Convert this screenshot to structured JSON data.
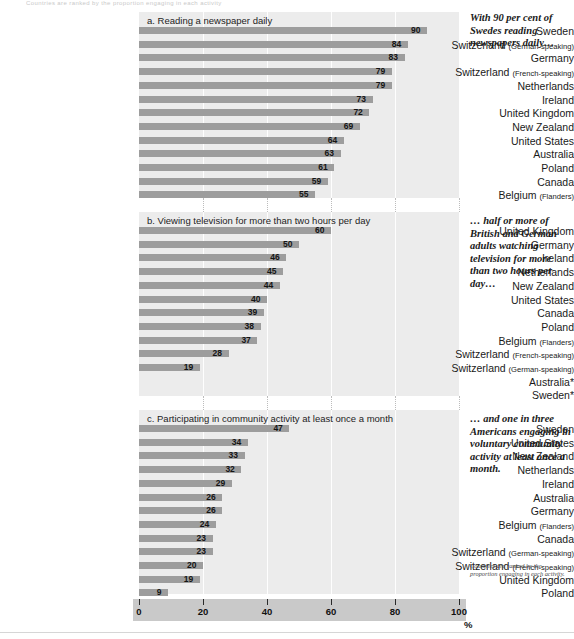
{
  "document": {
    "top_remnant": "Countries are ranked by the proportion engaging in each activity",
    "percent_symbol": "%",
    "footnote": "Countries are ranked by the proportion engaging in each activity."
  },
  "axis": {
    "ticks": [
      0,
      20,
      40,
      60,
      80,
      100
    ],
    "min": 0,
    "max": 100,
    "unit": "%"
  },
  "notes": {
    "a": "With 90 per cent of Swedes reading newspapers daily…",
    "b": "… half or more of British and German adults watching television for more than two hours per day…",
    "c": "… and one in three Americans engaging in voluntary community activity at least once a month."
  },
  "chart_data": [
    {
      "id": "a",
      "type": "bar",
      "orientation": "horizontal",
      "title": "a.  Reading a newspaper daily",
      "xlabel": "%",
      "ylabel": "",
      "xlim": [
        0,
        100
      ],
      "grid": true,
      "legend": "none",
      "categories": [
        "Sweden",
        "Switzerland (German-speaking)",
        "Germany",
        "Switzerland (French-speaking)",
        "Netherlands",
        "Ireland",
        "United Kingdom",
        "New Zealand",
        "United States",
        "Australia",
        "Poland",
        "Canada",
        "Belgium (Flanders)"
      ],
      "values": [
        90,
        84,
        83,
        79,
        79,
        73,
        72,
        69,
        64,
        63,
        61,
        59,
        55
      ]
    },
    {
      "id": "b",
      "type": "bar",
      "orientation": "horizontal",
      "title": "b.  Viewing television for more than two hours per day",
      "xlabel": "%",
      "ylabel": "",
      "xlim": [
        0,
        100
      ],
      "grid": true,
      "legend": "none",
      "categories": [
        "United Kingdom",
        "Germany",
        "Ireland",
        "Netherlands",
        "New Zealand",
        "United States",
        "Canada",
        "Poland",
        "Belgium (Flanders)",
        "Switzerland (French-speaking)",
        "Switzerland (German-speaking)",
        "Australia*",
        "Sweden*"
      ],
      "values": [
        60,
        50,
        46,
        45,
        44,
        40,
        39,
        38,
        37,
        28,
        19,
        null,
        null
      ]
    },
    {
      "id": "c",
      "type": "bar",
      "orientation": "horizontal",
      "title": "c.  Participating in community activity at least once a month",
      "xlabel": "%",
      "ylabel": "",
      "xlim": [
        0,
        100
      ],
      "grid": true,
      "legend": "none",
      "categories": [
        "Sweden",
        "United States",
        "New Zealand",
        "Netherlands",
        "Ireland",
        "Australia",
        "Germany",
        "Belgium (Flanders)",
        "Canada",
        "Switzerland (German-speaking)",
        "Switzerland (French-speaking)",
        "United Kingdom",
        "Poland"
      ],
      "values": [
        47,
        34,
        33,
        32,
        29,
        26,
        26,
        24,
        23,
        23,
        20,
        19,
        9
      ]
    }
  ]
}
